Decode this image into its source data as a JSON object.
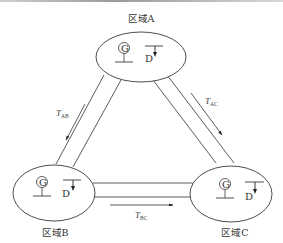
{
  "diagram": {
    "type": "power-system-interconnection",
    "regions": [
      {
        "id": "A",
        "label": "区域A",
        "generator_symbol": "G",
        "load_symbol": "D"
      },
      {
        "id": "B",
        "label": "区域B",
        "generator_symbol": "G",
        "load_symbol": "D"
      },
      {
        "id": "C",
        "label": "区域C",
        "generator_symbol": "G",
        "load_symbol": "D"
      }
    ],
    "transfers": [
      {
        "id": "AB",
        "label_main": "T",
        "label_sub": "AB",
        "from": "A",
        "to": "B"
      },
      {
        "id": "AC",
        "label_main": "T",
        "label_sub": "AC",
        "from": "A",
        "to": "C"
      },
      {
        "id": "BC",
        "label_main": "T",
        "label_sub": "BC",
        "from": "B",
        "to": "C"
      }
    ]
  },
  "colors": {
    "stroke": "#3a3a3a",
    "text": "#333333",
    "background": "#ffffff"
  }
}
